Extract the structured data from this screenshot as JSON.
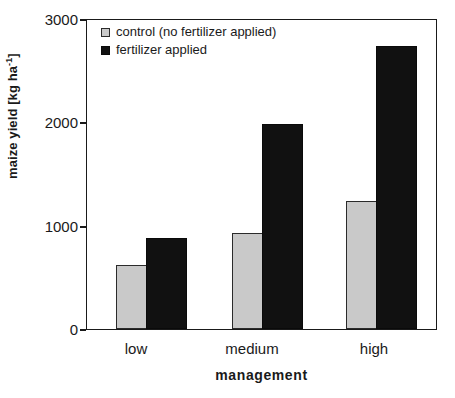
{
  "chart_data": {
    "type": "bar",
    "title": "",
    "subtitle": "",
    "xlabel": "management",
    "ylabel": "maize yield [kg ha-1]",
    "ylabel_base": "maize yield [kg ha",
    "ylabel_sup": "-1",
    "ylabel_tail": "]",
    "categories": [
      "low",
      "medium",
      "high"
    ],
    "series": [
      {
        "name": "control (no fertilizer applied)",
        "color": "#c9c9c9",
        "values": [
          620,
          935,
          1245
        ]
      },
      {
        "name": "fertilizer applied",
        "color": "#111111",
        "values": [
          890,
          2000,
          2760
        ]
      }
    ],
    "ylim": [
      0,
      3000
    ],
    "yticks": [
      0,
      1000,
      2000,
      3000
    ],
    "ytick_labels": [
      "0",
      "1000",
      "2000",
      "3000"
    ],
    "grid": false,
    "legend_position": "top-left"
  },
  "legend": {
    "entries": [
      {
        "label": "control (no fertilizer applied)",
        "swatch": "control"
      },
      {
        "label": "fertilizer applied",
        "swatch": "fert"
      }
    ]
  },
  "axes": {
    "y_title": "maize yield [kg ha-1]",
    "x_title": "management",
    "y_tick_0": "0",
    "y_tick_1": "1000",
    "y_tick_2": "2000",
    "y_tick_3": "3000",
    "x_tick_0": "low",
    "x_tick_1": "medium",
    "x_tick_2": "high"
  }
}
